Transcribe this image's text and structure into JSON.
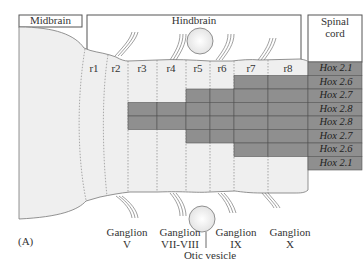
{
  "regions": {
    "midbrain": "Midbrain",
    "hindbrain": "Hindbrain",
    "spinal_cord_line1": "Spinal",
    "spinal_cord_line2": "cord"
  },
  "rhombomeres": [
    "r1",
    "r2",
    "r3",
    "r4",
    "r5",
    "r6",
    "r7",
    "r8"
  ],
  "hox_rows": [
    {
      "gene": "Hox",
      "number": "2.1",
      "label": "Hox 2.1",
      "shaded": [
        "spinal"
      ]
    },
    {
      "gene": "Hox",
      "number": "2.6",
      "label": "Hox 2.6",
      "shaded": [
        "r7",
        "r8",
        "spinal"
      ]
    },
    {
      "gene": "Hox",
      "number": "2.7",
      "label": "Hox 2.7",
      "shaded": [
        "r5",
        "r6",
        "r7",
        "r8",
        "spinal"
      ]
    },
    {
      "gene": "Hox",
      "number": "2.8",
      "label": "Hox 2.8",
      "shaded": [
        "r3",
        "r4",
        "r5",
        "r6",
        "r7",
        "r8",
        "spinal"
      ]
    },
    {
      "gene": "Hox",
      "number": "2.8",
      "label": "Hox 2.8",
      "shaded": [
        "r3",
        "r4",
        "r5",
        "r6",
        "r7",
        "r8",
        "spinal"
      ]
    },
    {
      "gene": "Hox",
      "number": "2.7",
      "label": "Hox 2.7",
      "shaded": [
        "r5",
        "r6",
        "r7",
        "r8",
        "spinal"
      ]
    },
    {
      "gene": "Hox",
      "number": "2.6",
      "label": "Hox 2.6",
      "shaded": [
        "r7",
        "r8",
        "spinal"
      ]
    },
    {
      "gene": "Hox",
      "number": "2.1",
      "label": "Hox 2.1",
      "shaded": [
        "spinal"
      ]
    }
  ],
  "ganglia": [
    {
      "line1": "Ganglion",
      "line2": "V"
    },
    {
      "line1": "Ganglion",
      "line2": "VII-VIII"
    },
    {
      "line1": "Ganglion",
      "line2": "IX"
    },
    {
      "line1": "Ganglion",
      "line2": "X"
    }
  ],
  "otic_vesicle": "Otic vesicle",
  "panel_label": "(A)",
  "colors": {
    "tissue": "#efefef",
    "shaded": "#8f8f8f",
    "outline": "#777777",
    "frame": "#555555"
  }
}
